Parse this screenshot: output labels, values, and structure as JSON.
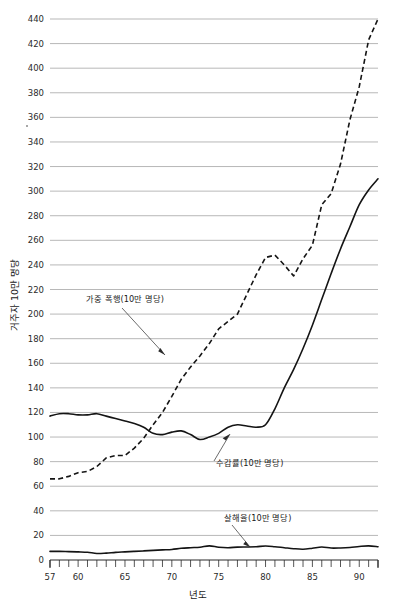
{
  "chart_data": {
    "type": "line",
    "title": "",
    "xlabel": "년도",
    "ylabel": "거주자 10만 명당",
    "xlim": [
      57,
      92
    ],
    "ylim": [
      0,
      450
    ],
    "grid": true,
    "legend_position": "inline-annotations",
    "y_ticks": [
      0,
      20,
      40,
      60,
      80,
      100,
      120,
      140,
      160,
      180,
      200,
      220,
      240,
      260,
      280,
      300,
      320,
      340,
      360,
      380,
      400,
      420,
      440
    ],
    "x_ticks_labeled": [
      57,
      60,
      65,
      70,
      75,
      80,
      85,
      90
    ],
    "x_ticks_minor_interval": 1,
    "x": [
      57,
      58,
      59,
      60,
      61,
      62,
      63,
      64,
      65,
      66,
      67,
      68,
      69,
      70,
      71,
      72,
      73,
      74,
      75,
      76,
      77,
      78,
      79,
      80,
      81,
      82,
      83,
      84,
      85,
      86,
      87,
      88,
      89,
      90,
      91,
      92
    ],
    "series": [
      {
        "name": "가중 폭행(10만 명당)",
        "style": "dashed",
        "annotation": "가중 폭행(10만 명당)",
        "values": [
          66,
          66,
          68,
          71,
          72,
          76,
          83,
          85,
          85,
          91,
          99,
          110,
          120,
          133,
          147,
          157,
          166,
          176,
          188,
          194,
          200,
          216,
          232,
          246,
          248,
          240,
          231,
          245,
          256,
          289,
          298,
          322,
          358,
          385,
          423,
          440
        ]
      },
      {
        "name": "수감률(10만 명당)",
        "style": "solid",
        "annotation": "수감률(10만 명당)",
        "values": [
          117,
          119,
          119,
          118,
          118,
          119,
          117,
          115,
          113,
          111,
          108,
          103,
          102,
          104,
          105,
          102,
          98,
          100,
          103,
          108,
          110,
          109,
          108,
          110,
          123,
          140,
          155,
          172,
          191,
          212,
          233,
          253,
          271,
          289,
          301,
          310
        ]
      },
      {
        "name": "살해율(10만 명당)",
        "style": "solid",
        "annotation": "살해율(10만 명당)",
        "values": [
          7.0,
          7.0,
          6.8,
          6.6,
          6.3,
          5.3,
          5.6,
          6.2,
          6.6,
          7.0,
          7.4,
          7.8,
          8.2,
          8.6,
          9.5,
          10.0,
          10.4,
          11.5,
          10.4,
          10.0,
          10.5,
          10.6,
          10.8,
          11.4,
          10.8,
          10.0,
          9.2,
          8.8,
          9.6,
          10.6,
          9.7,
          9.8,
          10.2,
          11.0,
          11.5,
          10.8
        ]
      }
    ]
  }
}
